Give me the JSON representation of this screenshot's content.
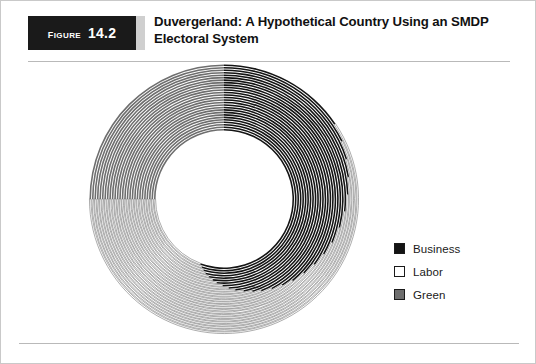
{
  "figure": {
    "word": "Figure",
    "number": "14.2"
  },
  "title": {
    "line1": "Duvergerland: A Hypothetical Country Using an SMDP",
    "line2": "Electoral System"
  },
  "legend": {
    "items": [
      {
        "label": "Business",
        "color": "#141414",
        "swatch": "business-swatch"
      },
      {
        "label": "Labor",
        "color": "#ffffff",
        "swatch": "labor-swatch"
      },
      {
        "label": "Green",
        "color": "#6e6e6e",
        "swatch": "green-swatch"
      }
    ]
  },
  "chart_data": {
    "type": "pie",
    "title": "Duvergerland: A Hypothetical Country Using an SMDP Electoral System",
    "subtype": "concentric-ring-donut",
    "center": [
      223,
      198
    ],
    "outer_radius": 135,
    "inner_radius": 68,
    "ring_count": 27,
    "ring_gap": 0.9,
    "categories": [
      "Business",
      "Labor",
      "Green"
    ],
    "colors": {
      "Business": "#141414",
      "Labor": "#ffffff",
      "Green": "#6e6e6e"
    },
    "legend_position": "right",
    "grid": false,
    "rings": [
      {
        "index": 1,
        "business_end": 200,
        "green_start": 270
      },
      {
        "index": 2,
        "business_end": 198,
        "green_start": 270
      },
      {
        "index": 3,
        "business_end": 196,
        "green_start": 270
      },
      {
        "index": 4,
        "business_end": 194,
        "green_start": 270
      },
      {
        "index": 5,
        "business_end": 191,
        "green_start": 270
      },
      {
        "index": 6,
        "business_end": 188,
        "green_start": 270
      },
      {
        "index": 7,
        "business_end": 185,
        "green_start": 270
      },
      {
        "index": 8,
        "business_end": 181,
        "green_start": 270
      },
      {
        "index": 9,
        "business_end": 177,
        "green_start": 270
      },
      {
        "index": 10,
        "business_end": 173,
        "green_start": 270
      },
      {
        "index": 11,
        "business_end": 168,
        "green_start": 270
      },
      {
        "index": 12,
        "business_end": 163,
        "green_start": 270
      },
      {
        "index": 13,
        "business_end": 158,
        "green_start": 270
      },
      {
        "index": 14,
        "business_end": 152,
        "green_start": 270
      },
      {
        "index": 15,
        "business_end": 146,
        "green_start": 270
      },
      {
        "index": 16,
        "business_end": 140,
        "green_start": 270
      },
      {
        "index": 17,
        "business_end": 133,
        "green_start": 270
      },
      {
        "index": 18,
        "business_end": 126,
        "green_start": 270
      },
      {
        "index": 19,
        "business_end": 119,
        "green_start": 270
      },
      {
        "index": 20,
        "business_end": 112,
        "green_start": 270
      },
      {
        "index": 21,
        "business_end": 104,
        "green_start": 270
      },
      {
        "index": 22,
        "business_end": 96,
        "green_start": 270
      },
      {
        "index": 23,
        "business_end": 88,
        "green_start": 270
      },
      {
        "index": 24,
        "business_end": 80,
        "green_start": 270
      },
      {
        "index": 25,
        "business_end": 72,
        "green_start": 270
      },
      {
        "index": 26,
        "business_end": 64,
        "green_start": 270
      },
      {
        "index": 27,
        "business_end": 56,
        "green_start": 270
      }
    ]
  }
}
